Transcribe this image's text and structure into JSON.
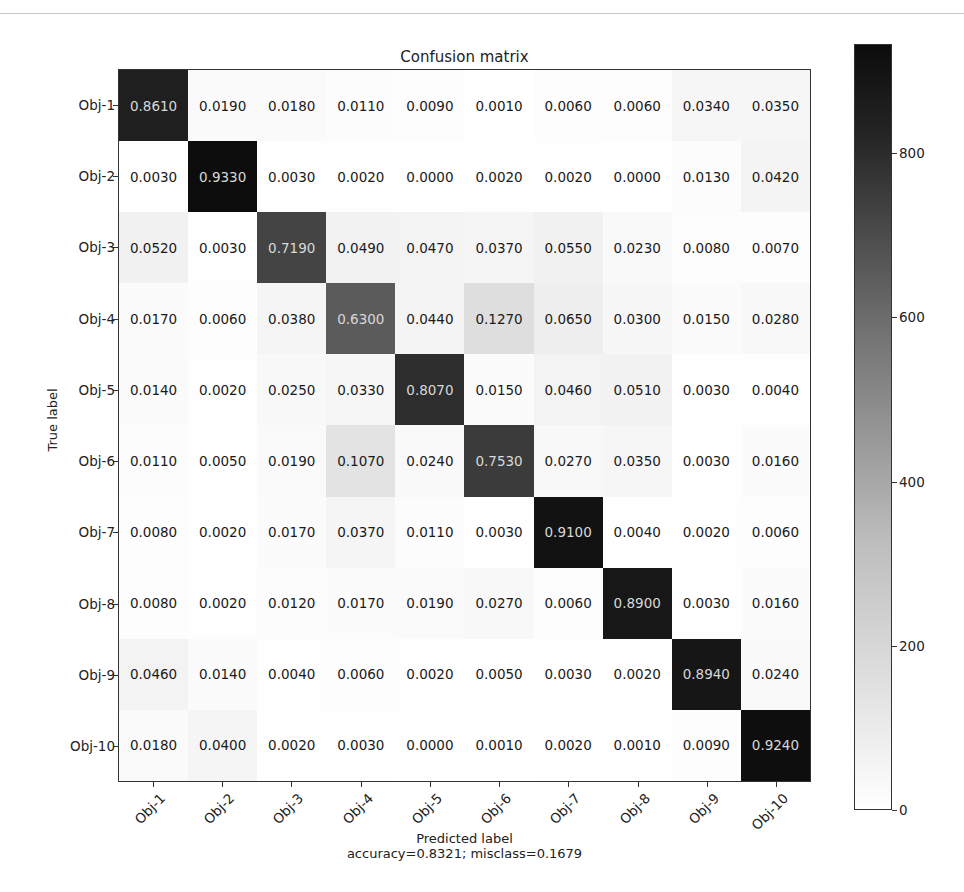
{
  "chart_data": {
    "type": "heatmap",
    "title": "Confusion matrix",
    "xlabel": "Predicted label",
    "xlabel_sub": "accuracy=0.8321; misclass=0.1679",
    "ylabel": "True label",
    "row_labels": [
      "Obj-1",
      "Obj-2",
      "Obj-3",
      "Obj-4",
      "Obj-5",
      "Obj-6",
      "Obj-7",
      "Obj-8",
      "Obj-9",
      "Obj-10"
    ],
    "col_labels": [
      "Obj-1",
      "Obj-2",
      "Obj-3",
      "Obj-4",
      "Obj-5",
      "Obj-6",
      "Obj-7",
      "Obj-8",
      "Obj-9",
      "Obj-10"
    ],
    "values": [
      [
        "0.8610",
        "0.0190",
        "0.0180",
        "0.0110",
        "0.0090",
        "0.0010",
        "0.0060",
        "0.0060",
        "0.0340",
        "0.0350"
      ],
      [
        "0.0030",
        "0.9330",
        "0.0030",
        "0.0020",
        "0.0000",
        "0.0020",
        "0.0020",
        "0.0000",
        "0.0130",
        "0.0420"
      ],
      [
        "0.0520",
        "0.0030",
        "0.7190",
        "0.0490",
        "0.0470",
        "0.0370",
        "0.0550",
        "0.0230",
        "0.0080",
        "0.0070"
      ],
      [
        "0.0170",
        "0.0060",
        "0.0380",
        "0.6300",
        "0.0440",
        "0.1270",
        "0.0650",
        "0.0300",
        "0.0150",
        "0.0280"
      ],
      [
        "0.0140",
        "0.0020",
        "0.0250",
        "0.0330",
        "0.8070",
        "0.0150",
        "0.0460",
        "0.0510",
        "0.0030",
        "0.0040"
      ],
      [
        "0.0110",
        "0.0050",
        "0.0190",
        "0.1070",
        "0.0240",
        "0.7530",
        "0.0270",
        "0.0350",
        "0.0030",
        "0.0160"
      ],
      [
        "0.0080",
        "0.0020",
        "0.0170",
        "0.0370",
        "0.0110",
        "0.0030",
        "0.9100",
        "0.0040",
        "0.0020",
        "0.0060"
      ],
      [
        "0.0080",
        "0.0020",
        "0.0120",
        "0.0170",
        "0.0190",
        "0.0270",
        "0.0060",
        "0.8900",
        "0.0030",
        "0.0160"
      ],
      [
        "0.0460",
        "0.0140",
        "0.0040",
        "0.0060",
        "0.0020",
        "0.0050",
        "0.0030",
        "0.0020",
        "0.8940",
        "0.0240"
      ],
      [
        "0.0180",
        "0.0400",
        "0.0020",
        "0.0030",
        "0.0000",
        "0.0010",
        "0.0020",
        "0.0010",
        "0.0090",
        "0.9240"
      ]
    ],
    "colorbar": {
      "ticks": [
        "0",
        "200",
        "400",
        "600",
        "800"
      ],
      "vmin": 0,
      "vmax": 933,
      "colormap": "Greys"
    },
    "grid": false
  }
}
